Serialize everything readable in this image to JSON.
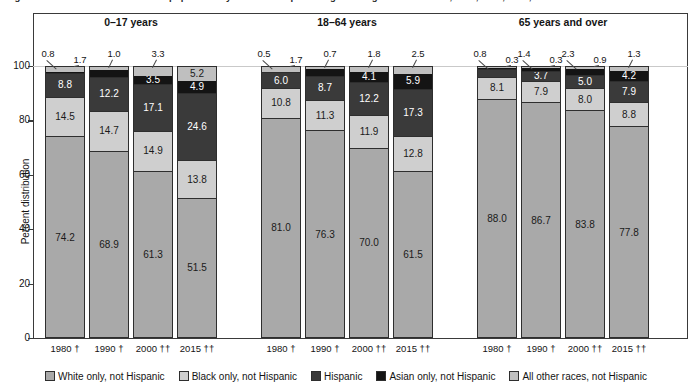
{
  "figure": {
    "title": "Figure 2. Percent distribution of the population by race and Hispanic origin and age: United States, 1980, 1990, 2000, and 2015",
    "ylabel": "Percent distribution",
    "yticks": [
      "0",
      "20",
      "40",
      "60",
      "80",
      "100"
    ],
    "ylim": [
      0,
      100
    ]
  },
  "groups": [
    {
      "header": "0–17 years"
    },
    {
      "header": "18–64 years"
    },
    {
      "header": "65 years and over"
    }
  ],
  "series": [
    {
      "name": "White only, not Hispanic",
      "color": "#a9a9a9",
      "textColor": "#1a1a1a"
    },
    {
      "name": "Black only, not Hispanic",
      "color": "#cfcfcf",
      "textColor": "#1a1a1a"
    },
    {
      "name": "Hispanic",
      "color": "#3a3a3a",
      "textColor": "#ffffff"
    },
    {
      "name": "Asian only, not Hispanic",
      "color": "#141414",
      "textColor": "#ffffff"
    },
    {
      "name": "All other races, not Hispanic",
      "color": "#bfbfbf",
      "textColor": "#1a1a1a"
    }
  ],
  "bars": [
    {
      "group": 0,
      "x_label": "1980 †",
      "values": [
        74.2,
        14.5,
        8.8,
        0.8,
        1.7
      ],
      "inside": [
        "74.2",
        "14.5",
        "8.8",
        "",
        ""
      ],
      "outside": [
        "0.8",
        "1.7"
      ]
    },
    {
      "group": 0,
      "x_label": "1990 †",
      "values": [
        68.9,
        14.7,
        12.2,
        3.1,
        1.0
      ],
      "inside": [
        "68.9",
        "14.7",
        "12.2",
        "3.1",
        ""
      ],
      "outside": [
        "1.0"
      ]
    },
    {
      "group": 0,
      "x_label": "2000 ††",
      "values": [
        61.3,
        14.9,
        17.1,
        3.5,
        3.3
      ],
      "inside": [
        "61.3",
        "14.9",
        "17.1",
        "3.5",
        ""
      ],
      "outside": [
        "3.3"
      ]
    },
    {
      "group": 0,
      "x_label": "2015 ††",
      "values": [
        51.5,
        13.8,
        24.6,
        4.9,
        5.2
      ],
      "inside": [
        "51.5",
        "13.8",
        "24.6",
        "4.9",
        "5.2"
      ],
      "outside": []
    },
    {
      "group": 1,
      "x_label": "1980 †",
      "values": [
        81.0,
        10.8,
        6.0,
        0.5,
        1.7
      ],
      "inside": [
        "81.0",
        "10.8",
        "6.0",
        "",
        ""
      ],
      "outside": [
        "0.5",
        "1.7"
      ]
    },
    {
      "group": 1,
      "x_label": "1990 †",
      "values": [
        76.3,
        11.3,
        8.7,
        3.0,
        0.7
      ],
      "inside": [
        "76.3",
        "11.3",
        "8.7",
        "3.0",
        ""
      ],
      "outside": [
        "0.7"
      ]
    },
    {
      "group": 1,
      "x_label": "2000 ††",
      "values": [
        70.0,
        11.9,
        12.2,
        4.1,
        1.8
      ],
      "inside": [
        "70.0",
        "11.9",
        "12.2",
        "4.1",
        ""
      ],
      "outside": [
        "1.8"
      ]
    },
    {
      "group": 1,
      "x_label": "2015 ††",
      "values": [
        61.5,
        12.8,
        17.3,
        5.9,
        2.5
      ],
      "inside": [
        "61.5",
        "12.8",
        "17.3",
        "5.9",
        ""
      ],
      "outside": [
        "2.5"
      ]
    },
    {
      "group": 2,
      "x_label": "1980 †",
      "values": [
        88.0,
        8.1,
        2.8,
        0.8,
        0.3
      ],
      "inside": [
        "88.0",
        "8.1",
        "2.8",
        "",
        ""
      ],
      "outside": [
        "0.8",
        "0.3"
      ]
    },
    {
      "group": 2,
      "x_label": "1990 †",
      "values": [
        86.7,
        7.9,
        3.7,
        1.4,
        0.3
      ],
      "inside": [
        "86.7",
        "7.9",
        "3.7",
        "",
        ""
      ],
      "outside": [
        "1.4",
        "0.3"
      ]
    },
    {
      "group": 2,
      "x_label": "2000 ††",
      "values": [
        83.8,
        8.0,
        5.0,
        2.3,
        0.9
      ],
      "inside": [
        "83.8",
        "8.0",
        "5.0",
        "",
        ""
      ],
      "outside": [
        "2.3",
        "0.9"
      ]
    },
    {
      "group": 2,
      "x_label": "2015 ††",
      "values": [
        77.8,
        8.8,
        7.9,
        4.2,
        1.3
      ],
      "inside": [
        "77.8",
        "8.8",
        "7.9",
        "4.2",
        ""
      ],
      "outside": [
        "1.3"
      ]
    }
  ],
  "chart_data": {
    "type": "bar",
    "title": "Percent distribution of the population by race and Hispanic origin and age: United States, 1980, 1990, 2000, and 2015",
    "xlabel": "",
    "ylabel": "Percent distribution",
    "ylim": [
      0,
      100
    ],
    "grid": false,
    "stacked": true,
    "legend_position": "bottom",
    "group_labels": [
      "0–17 years",
      "18–64 years",
      "65 years and over"
    ],
    "categories": [
      "0–17 years / 1980 †",
      "0–17 years / 1990 †",
      "0–17 years / 2000 ††",
      "0–17 years / 2015 ††",
      "18–64 years / 1980 †",
      "18–64 years / 1990 †",
      "18–64 years / 2000 ††",
      "18–64 years / 2015 ††",
      "65 years and over / 1980 †",
      "65 years and over / 1990 †",
      "65 years and over / 2000 ††",
      "65 years and over / 2015 ††"
    ],
    "series": [
      {
        "name": "White only, not Hispanic",
        "values": [
          74.2,
          68.9,
          61.3,
          51.5,
          81.0,
          76.3,
          70.0,
          61.5,
          88.0,
          86.7,
          83.8,
          77.8
        ]
      },
      {
        "name": "Black only, not Hispanic",
        "values": [
          14.5,
          14.7,
          14.9,
          13.8,
          10.8,
          11.3,
          11.9,
          12.8,
          8.1,
          7.9,
          8.0,
          8.8
        ]
      },
      {
        "name": "Hispanic",
        "values": [
          8.8,
          12.2,
          17.1,
          24.6,
          6.0,
          8.7,
          12.2,
          17.3,
          2.8,
          3.7,
          5.0,
          7.9
        ]
      },
      {
        "name": "Asian only, not Hispanic",
        "values": [
          0.8,
          3.1,
          3.5,
          4.9,
          0.5,
          3.0,
          4.1,
          5.9,
          0.8,
          1.4,
          2.3,
          4.2
        ]
      },
      {
        "name": "All other races, not Hispanic",
        "values": [
          1.7,
          1.0,
          3.3,
          5.2,
          1.7,
          0.7,
          1.8,
          2.5,
          0.3,
          0.3,
          0.9,
          1.3
        ]
      }
    ],
    "yticks": [
      0,
      20,
      40,
      60,
      80,
      100
    ]
  }
}
